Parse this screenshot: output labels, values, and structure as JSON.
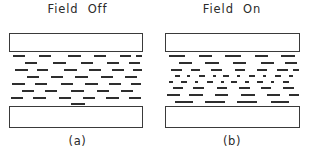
{
  "figure": {
    "type": "diagram",
    "background_color": "#ffffff",
    "ink_color": "#2e2e2e"
  },
  "panels": [
    {
      "id": "a",
      "title": "Field  Off",
      "caption": "(a)",
      "plate_top_label": "upper plate",
      "plate_bottom_label": "lower plate",
      "state": "field-off",
      "molecule_rows": [
        {
          "y": 3,
          "dashes": [
            {
              "x": 4,
              "w": 12
            },
            {
              "x": 30,
              "w": 12
            },
            {
              "x": 59,
              "w": 13
            },
            {
              "x": 85,
              "w": 12
            },
            {
              "x": 111,
              "w": 11
            },
            {
              "x": 127,
              "w": 6
            }
          ]
        },
        {
          "y": 10,
          "dashes": [
            {
              "x": 16,
              "w": 12
            },
            {
              "x": 44,
              "w": 13
            },
            {
              "x": 72,
              "w": 12
            },
            {
              "x": 98,
              "w": 12
            },
            {
              "x": 120,
              "w": 11
            }
          ]
        },
        {
          "y": 17,
          "dashes": [
            {
              "x": 6,
              "w": 13
            },
            {
              "x": 28,
              "w": 11
            },
            {
              "x": 55,
              "w": 13
            },
            {
              "x": 80,
              "w": 12
            },
            {
              "x": 103,
              "w": 12
            },
            {
              "x": 124,
              "w": 9
            }
          ]
        },
        {
          "y": 24,
          "dashes": [
            {
              "x": 18,
              "w": 12
            },
            {
              "x": 42,
              "w": 12
            },
            {
              "x": 66,
              "w": 13
            },
            {
              "x": 92,
              "w": 12
            },
            {
              "x": 116,
              "w": 12
            }
          ]
        },
        {
          "y": 31,
          "dashes": [
            {
              "x": 3,
              "w": 13
            },
            {
              "x": 26,
              "w": 12
            },
            {
              "x": 52,
              "w": 12
            },
            {
              "x": 76,
              "w": 13
            },
            {
              "x": 100,
              "w": 12
            },
            {
              "x": 122,
              "w": 10
            }
          ]
        },
        {
          "y": 38,
          "dashes": [
            {
              "x": 13,
              "w": 12
            },
            {
              "x": 36,
              "w": 12
            },
            {
              "x": 62,
              "w": 13
            },
            {
              "x": 88,
              "w": 12
            },
            {
              "x": 112,
              "w": 12
            }
          ]
        },
        {
          "y": 45,
          "dashes": [
            {
              "x": 2,
              "w": 12
            },
            {
              "x": 24,
              "w": 13
            },
            {
              "x": 50,
              "w": 12
            },
            {
              "x": 74,
              "w": 12
            },
            {
              "x": 97,
              "w": 13
            },
            {
              "x": 120,
              "w": 12
            }
          ]
        },
        {
          "y": 51,
          "dashes": [
            {
              "x": 62,
              "w": 14
            }
          ]
        }
      ]
    },
    {
      "id": "b",
      "title": "Field  On",
      "caption": "(b)",
      "plate_top_label": "upper plate",
      "plate_bottom_label": "lower plate",
      "state": "field-on",
      "molecule_rows": [
        {
          "y": 3,
          "dashes": [
            {
              "x": 4,
              "w": 16
            },
            {
              "x": 34,
              "w": 13
            },
            {
              "x": 60,
              "w": 16
            },
            {
              "x": 90,
              "w": 13
            },
            {
              "x": 116,
              "w": 14
            }
          ]
        },
        {
          "y": 10,
          "dashes": [
            {
              "x": 14,
              "w": 13
            },
            {
              "x": 40,
              "w": 14
            },
            {
              "x": 68,
              "w": 13
            },
            {
              "x": 96,
              "w": 13
            },
            {
              "x": 120,
              "w": 12
            }
          ]
        },
        {
          "y": 17,
          "dashes": [
            {
              "x": 6,
              "w": 11
            },
            {
              "x": 26,
              "w": 9
            },
            {
              "x": 46,
              "w": 11
            },
            {
              "x": 70,
              "w": 10
            },
            {
              "x": 92,
              "w": 10
            },
            {
              "x": 112,
              "w": 11
            },
            {
              "x": 128,
              "w": 6
            }
          ]
        },
        {
          "y": 23,
          "dashes": [
            {
              "x": 10,
              "w": 5
            },
            {
              "x": 22,
              "w": 3
            },
            {
              "x": 34,
              "w": 6
            },
            {
              "x": 48,
              "w": 3
            },
            {
              "x": 58,
              "w": 6
            },
            {
              "x": 72,
              "w": 3
            },
            {
              "x": 84,
              "w": 6
            },
            {
              "x": 98,
              "w": 3
            },
            {
              "x": 110,
              "w": 6
            },
            {
              "x": 124,
              "w": 4
            }
          ]
        },
        {
          "y": 29,
          "dashes": [
            {
              "x": 4,
              "w": 4
            },
            {
              "x": 16,
              "w": 6
            },
            {
              "x": 30,
              "w": 3
            },
            {
              "x": 42,
              "w": 6
            },
            {
              "x": 56,
              "w": 3
            },
            {
              "x": 66,
              "w": 6
            },
            {
              "x": 80,
              "w": 4
            },
            {
              "x": 92,
              "w": 6
            },
            {
              "x": 106,
              "w": 3
            },
            {
              "x": 118,
              "w": 6
            }
          ]
        },
        {
          "y": 35,
          "dashes": [
            {
              "x": 8,
              "w": 10
            },
            {
              "x": 28,
              "w": 11
            },
            {
              "x": 52,
              "w": 10
            },
            {
              "x": 74,
              "w": 11
            },
            {
              "x": 96,
              "w": 10
            },
            {
              "x": 118,
              "w": 11
            }
          ]
        },
        {
          "y": 42,
          "dashes": [
            {
              "x": 2,
              "w": 13
            },
            {
              "x": 24,
              "w": 14
            },
            {
              "x": 50,
              "w": 13
            },
            {
              "x": 76,
              "w": 14
            },
            {
              "x": 102,
              "w": 13
            },
            {
              "x": 124,
              "w": 10
            }
          ]
        },
        {
          "y": 49,
          "dashes": [
            {
              "x": 10,
              "w": 18
            },
            {
              "x": 40,
              "w": 20
            },
            {
              "x": 72,
              "w": 20
            },
            {
              "x": 106,
              "w": 18
            }
          ]
        }
      ]
    }
  ]
}
